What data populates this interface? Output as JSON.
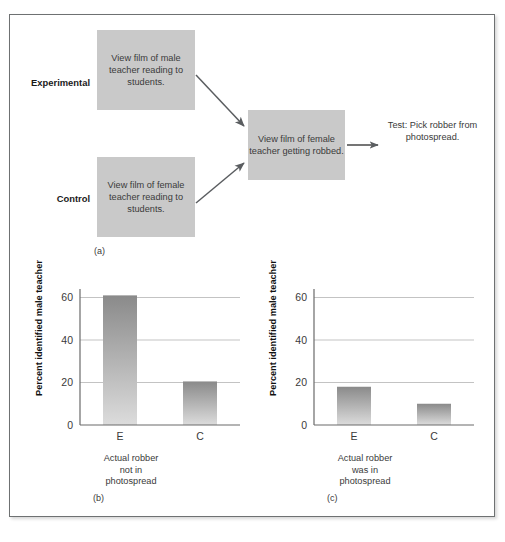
{
  "figure": {
    "panels": [
      {
        "tag": "(a)",
        "name": "flow-diagram"
      },
      {
        "tag": "(b)",
        "name": "bar-chart-robber-not-in-photospread"
      },
      {
        "tag": "(c)",
        "name": "bar-chart-robber-was-in-photospread"
      }
    ]
  },
  "flow": {
    "group_labels": {
      "experimental": "Experimental",
      "control": "Control"
    },
    "boxes": {
      "experimental_film": "View film of male teacher reading to students.",
      "control_film": "View film of female teacher reading to students.",
      "robbery_film": "View film of female teacher getting robbed."
    },
    "test_text": "Test: Pick robber from photospread.",
    "box_fill": "#c9c9c9",
    "arrow_color": "#5a5d60"
  },
  "chart_data": [
    {
      "type": "bar",
      "panel": "(b)",
      "title": "",
      "categories": [
        "E",
        "C"
      ],
      "values": [
        61,
        20.5
      ],
      "ylabel": "Percent identified male teacher",
      "xlabel": "Actual robber not in photospread",
      "xlabel_lines": [
        "Actual robber",
        "not in",
        "photospread"
      ],
      "yticks": [
        0,
        20,
        40,
        60
      ],
      "ylim": [
        0,
        64
      ],
      "grid": true,
      "bar_color_top": "#8d8d8d",
      "bar_color_bottom": "#d6d6d6"
    },
    {
      "type": "bar",
      "panel": "(c)",
      "title": "",
      "categories": [
        "E",
        "C"
      ],
      "values": [
        18,
        10
      ],
      "ylabel": "Percent identified male teacher",
      "xlabel": "Actual robber was in photospread",
      "xlabel_lines": [
        "Actual robber",
        "was in",
        "photospread"
      ],
      "yticks": [
        0,
        20,
        40,
        60
      ],
      "ylim": [
        0,
        64
      ],
      "grid": true,
      "bar_color_top": "#8d8d8d",
      "bar_color_bottom": "#d6d6d6"
    }
  ]
}
